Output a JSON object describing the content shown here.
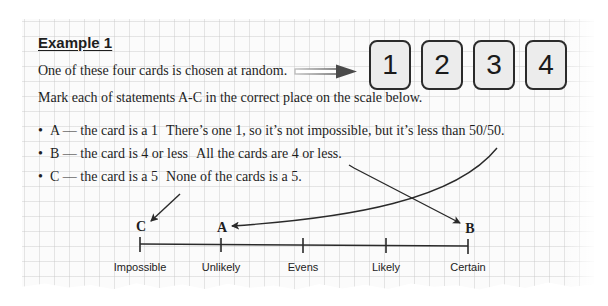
{
  "example": {
    "title": "Example 1",
    "intro": "One of these four cards is chosen at random.",
    "instruction": "Mark each of statements A-C in the correct place on the scale below."
  },
  "cards": [
    "1",
    "2",
    "3",
    "4"
  ],
  "statements": [
    {
      "bullet": "•",
      "label": "A — the card is a 1",
      "explanation": "There’s one 1, so it’s not impossible, but it’s less than 50/50."
    },
    {
      "bullet": "•",
      "label": "B — the card is 4 or less",
      "explanation": "All the cards are 4 or less."
    },
    {
      "bullet": "•",
      "label": "C — the card is a 5",
      "explanation": "None of the cards is a 5."
    }
  ],
  "scale": {
    "labels": [
      "Impossible",
      "Unlikely",
      "Evens",
      "Likely",
      "Certain"
    ],
    "marks": [
      {
        "letter": "C",
        "position": "Impossible"
      },
      {
        "letter": "A",
        "position": "Unlikely"
      },
      {
        "letter": "B",
        "position": "Certain"
      }
    ]
  },
  "colors": {
    "ink": "#1e1e1e",
    "card_fill": "#ececec",
    "grid": "#c8c8c8"
  }
}
